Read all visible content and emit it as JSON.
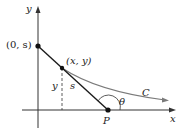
{
  "diagram": {
    "axes": {
      "x_label": "x",
      "y_label": "y"
    },
    "points": {
      "y_intercept": "(0, s)",
      "curve_point": "(x, y)",
      "P": "P"
    },
    "labels": {
      "height": "y",
      "segment": "s",
      "angle": "θ",
      "curve": "C"
    },
    "colors": {
      "curve": "#7a7a7a",
      "tangent": "#1a1a1a",
      "axes": "#333333"
    }
  }
}
